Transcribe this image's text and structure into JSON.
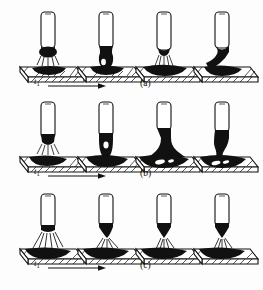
{
  "figure": {
    "type": "technical-illustration",
    "background_color": "#fdfdfd",
    "ink_color": "#111111",
    "rows": [
      {
        "id": "a",
        "label": "(a)",
        "time_label": "t",
        "time_subscript": "1",
        "arrow_direction": "right",
        "frame_count": 4,
        "frames": [
          {
            "index": 1,
            "caption": "",
            "mode": "arc-spray-short",
            "electrode_tip": "dark-molten-blob",
            "pool": "flat-dark-bead"
          },
          {
            "index": 2,
            "caption": "",
            "mode": "droplet-contact",
            "electrode_tip": "large-dark-droplet",
            "pool": "flat-dark-bead"
          },
          {
            "index": 3,
            "caption": "",
            "mode": "arc-reignition",
            "electrode_tip": "narrow-dark-taper",
            "pool": "wide-dark-bead"
          },
          {
            "index": 4,
            "caption": "",
            "mode": "bridge-transfer",
            "electrode_tip": "dark-neck-to-pool",
            "pool": "dark-bead"
          }
        ]
      },
      {
        "id": "b",
        "label": "(b)",
        "time_label": "t",
        "time_subscript": "1",
        "arrow_direction": "right",
        "frame_count": 4,
        "frames": [
          {
            "index": 1,
            "caption": "",
            "mode": "arc-spray-short",
            "electrode_tip": "dark-tip",
            "pool": "flat-dark-bead"
          },
          {
            "index": 2,
            "caption": "",
            "mode": "droplet-touching-pool",
            "electrode_tip": "dark-droplet-with-void",
            "pool": "flat-dark-bead"
          },
          {
            "index": 3,
            "caption": "",
            "mode": "large-short-circuit-bridge",
            "electrode_tip": "broad-dark-cone",
            "pool": "deep-dark-pool-with-voids"
          },
          {
            "index": 4,
            "caption": "",
            "mode": "necking-separation",
            "electrode_tip": "dark-neck",
            "pool": "dark-pool-with-voids"
          }
        ]
      },
      {
        "id": "c",
        "label": "(c)",
        "time_label": "t",
        "time_subscript": "1",
        "arrow_direction": "right",
        "frame_count": 4,
        "frames": [
          {
            "index": 1,
            "caption": "",
            "mode": "spray-arc-wide",
            "electrode_tip": "short-dark-tip",
            "pool": "shallow-dark-pool"
          },
          {
            "index": 2,
            "caption": "",
            "mode": "spray-arc-tapered",
            "electrode_tip": "long-dark-taper",
            "pool": "shallow-dark-pool"
          },
          {
            "index": 3,
            "caption": "",
            "mode": "spray-arc-narrow",
            "electrode_tip": "dark-taper",
            "pool": "shallow-dark-pool"
          },
          {
            "index": 4,
            "caption": "",
            "mode": "spray-arc-steady",
            "electrode_tip": "dark-taper",
            "pool": "shallow-dark-pool"
          }
        ]
      }
    ],
    "legend": {
      "workpiece": "hatched-plate",
      "electrode": "white-cylinder",
      "molten_metal": "solid-black",
      "arc": "radiating-lines"
    }
  }
}
